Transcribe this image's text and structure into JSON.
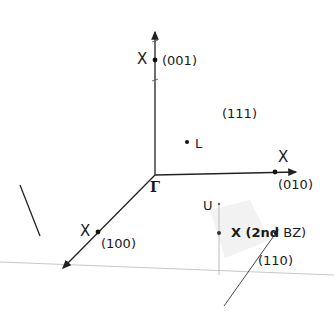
{
  "diagram": {
    "origin": {
      "label": "Γ"
    },
    "axes": [
      {
        "direction": "(001)",
        "point_label": "X"
      },
      {
        "direction": "(010)",
        "point_label": "X"
      },
      {
        "direction": "(100)",
        "point_label": "X"
      }
    ],
    "points": {
      "L": {
        "label": "L",
        "plane": "(111)"
      },
      "U": {
        "label": "U"
      },
      "X2": {
        "label_main": "X (2nd",
        "label_tail": "BZ)",
        "direction": "(110)"
      }
    }
  }
}
